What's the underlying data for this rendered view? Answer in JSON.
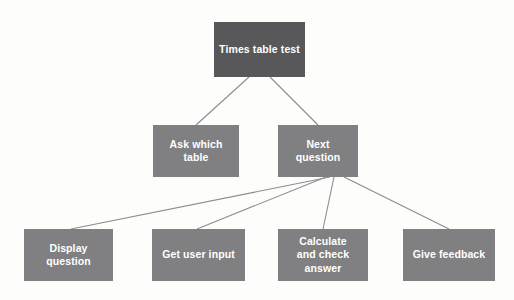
{
  "diagram": {
    "type": "hierarchy-tree",
    "title_text": "Times table test",
    "background_color": "#fdfdfb",
    "root_node_color": "#58585a",
    "child_node_color": "#808082",
    "node_text_color": "#ffffff",
    "connector_color": "#8c8c8e",
    "nodes": [
      {
        "id": "root",
        "label": "Times table test",
        "level": 0,
        "x": 214,
        "y": 22,
        "w": 91,
        "h": 55
      },
      {
        "id": "ask-which-table",
        "label": "Ask which table",
        "level": 1,
        "x": 153,
        "y": 125,
        "w": 86,
        "h": 52
      },
      {
        "id": "next-question",
        "label": "Next question",
        "level": 1,
        "x": 278,
        "y": 125,
        "w": 80,
        "h": 52
      },
      {
        "id": "display-question",
        "label": "Display question",
        "level": 2,
        "x": 24,
        "y": 229,
        "w": 89,
        "h": 52
      },
      {
        "id": "get-user-input",
        "label": "Get user input",
        "level": 2,
        "x": 152,
        "y": 229,
        "w": 93,
        "h": 52
      },
      {
        "id": "calculate-and-check-answer",
        "label": "Calculate\nand check answer",
        "level": 2,
        "x": 278,
        "y": 229,
        "w": 90,
        "h": 52
      },
      {
        "id": "give-feedback",
        "label": "Give feedback",
        "level": 2,
        "x": 403,
        "y": 229,
        "w": 92,
        "h": 52
      }
    ],
    "connectors": [
      {
        "id": "root-to-ask-which-table",
        "from": "root",
        "to": "ask-which-table",
        "x1": 249,
        "y1": 77,
        "x2": 196,
        "y2": 125
      },
      {
        "id": "root-to-next-question",
        "from": "root",
        "to": "next-question",
        "x1": 270,
        "y1": 77,
        "x2": 318,
        "y2": 125
      },
      {
        "id": "next-question-to-display-question",
        "from": "next-question",
        "to": "display-question",
        "x1": 330,
        "y1": 177,
        "x2": 71,
        "y2": 229
      },
      {
        "id": "next-question-to-get-user-input",
        "from": "next-question",
        "to": "get-user-input",
        "x1": 326,
        "y1": 177,
        "x2": 197,
        "y2": 229
      },
      {
        "id": "next-question-to-calculate-and-check-answer",
        "from": "next-question",
        "to": "calculate-and-check-answer",
        "x1": 334,
        "y1": 177,
        "x2": 323,
        "y2": 229
      },
      {
        "id": "next-question-to-give-feedback",
        "from": "next-question",
        "to": "give-feedback",
        "x1": 344,
        "y1": 177,
        "x2": 449,
        "y2": 229
      }
    ]
  }
}
